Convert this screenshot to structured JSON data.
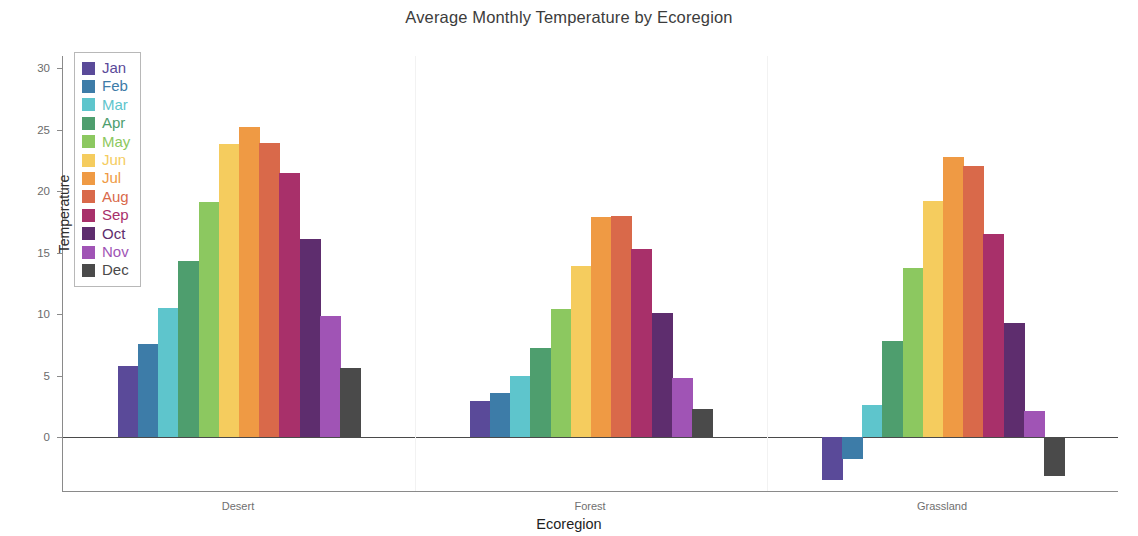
{
  "chart_data": {
    "type": "bar",
    "title": "Average Monthly Temperature by Ecoregion",
    "xlabel": "Ecoregion",
    "ylabel": "Temperature",
    "categories": [
      "Desert",
      "Forest",
      "Grassland"
    ],
    "ylim": [
      -4.5,
      31.5
    ],
    "yticks": [
      0,
      5,
      10,
      15,
      20,
      25,
      30
    ],
    "grid": false,
    "legend_position": "upper left",
    "series": [
      {
        "name": "Jan",
        "color": "#5a4a99",
        "values": [
          5.8,
          2.9,
          -3.5
        ]
      },
      {
        "name": "Feb",
        "color": "#3d7ca8",
        "values": [
          7.6,
          3.6,
          -1.8
        ]
      },
      {
        "name": "Mar",
        "color": "#5ec5cc",
        "values": [
          10.5,
          5.0,
          2.6
        ]
      },
      {
        "name": "Apr",
        "color": "#4e9e6e",
        "values": [
          14.3,
          7.2,
          7.8
        ]
      },
      {
        "name": "May",
        "color": "#8cc860",
        "values": [
          19.1,
          10.4,
          13.7
        ]
      },
      {
        "name": "Jun",
        "color": "#f5cc5e",
        "values": [
          23.8,
          13.9,
          19.2
        ]
      },
      {
        "name": "Jul",
        "color": "#ef9a44",
        "values": [
          25.2,
          17.9,
          22.8
        ]
      },
      {
        "name": "Aug",
        "color": "#d9694a",
        "values": [
          23.9,
          18.0,
          22.0
        ]
      },
      {
        "name": "Sep",
        "color": "#a8306a",
        "values": [
          21.5,
          15.3,
          16.5
        ]
      },
      {
        "name": "Oct",
        "color": "#5e2d6e",
        "values": [
          16.1,
          10.1,
          9.3
        ]
      },
      {
        "name": "Nov",
        "color": "#a054b5",
        "values": [
          9.8,
          4.8,
          2.1
        ]
      },
      {
        "name": "Dec",
        "color": "#4a4a4a",
        "values": [
          5.6,
          2.3,
          -3.2
        ]
      }
    ]
  },
  "legend": {
    "items": [
      "Jan",
      "Feb",
      "Mar",
      "Apr",
      "May",
      "Jun",
      "Jul",
      "Aug",
      "Sep",
      "Oct",
      "Nov",
      "Dec"
    ]
  }
}
